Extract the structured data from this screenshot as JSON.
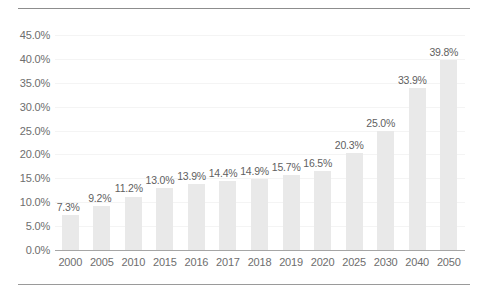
{
  "chart_data": {
    "type": "bar",
    "title": "",
    "subtitle": "",
    "xlabel": "",
    "ylabel": "",
    "categories": [
      "2000",
      "2005",
      "2010",
      "2015",
      "2016",
      "2017",
      "2018",
      "2019",
      "2020",
      "2025",
      "2030",
      "2040",
      "2050"
    ],
    "values": [
      7.3,
      9.2,
      11.2,
      13.0,
      13.9,
      14.4,
      14.9,
      15.7,
      16.5,
      20.3,
      25.0,
      33.9,
      39.8
    ],
    "data_labels": [
      "7.3%",
      "9.2%",
      "11.2%",
      "13.0%",
      "13.9%",
      "14.4%",
      "14.9%",
      "15.7%",
      "16.5%",
      "20.3%",
      "25.0%",
      "33.9%",
      "39.8%"
    ],
    "ylim": [
      0,
      45
    ],
    "ytick_values": [
      0,
      5,
      10,
      15,
      20,
      25,
      30,
      35,
      40,
      45
    ],
    "ytick_labels": [
      "0.0%",
      "5.0%",
      "10.0%",
      "15.0%",
      "20.0%",
      "25.0%",
      "30.0%",
      "35.0%",
      "40.0%",
      "45.0%"
    ],
    "grid": true,
    "legend": false,
    "legend_position": "none",
    "series": [
      {
        "name": "",
        "values": [
          7.3,
          9.2,
          11.2,
          13.0,
          13.9,
          14.4,
          14.9,
          15.7,
          16.5,
          20.3,
          25.0,
          33.9,
          39.8
        ]
      }
    ],
    "colors": {
      "bar": "#E9E9E9",
      "axis_text": "#6E6E6E",
      "data_label_text": "#5F5F5F",
      "gridline": "#F4F4F4",
      "axis_line": "#A6A6A6",
      "rule": "#8D8D8D",
      "background": "#FFFFFF"
    }
  }
}
